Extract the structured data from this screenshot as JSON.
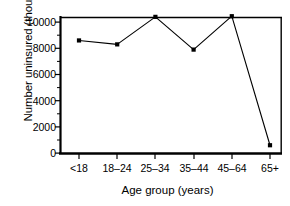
{
  "chart_data": {
    "type": "line",
    "title": "",
    "xlabel": "Age group (years)",
    "ylabel": "Number uninsured (thousands)",
    "categories": [
      "<18",
      "18–24",
      "25–34",
      "35–44",
      "45–64",
      "65+"
    ],
    "values": [
      8600,
      8300,
      10400,
      7900,
      10450,
      600
    ],
    "series": [
      {
        "name": "Number uninsured",
        "values": [
          8600,
          8300,
          10400,
          7900,
          10450,
          600
        ]
      }
    ],
    "ylim": [
      0,
      11200
    ],
    "yticks": [
      0,
      2000,
      4000,
      6000,
      8000,
      10000
    ],
    "ytick_labels": [
      "0",
      "2000",
      "4000",
      "6000",
      "8000",
      "10000"
    ],
    "xtick_labels": [
      "<18",
      "18–24",
      "25–34",
      "35–44",
      "45–64",
      "65+"
    ],
    "grid": false,
    "legend": "none",
    "marker": "filled-square",
    "line_color": "#000000",
    "marker_color": "#000000",
    "axis_color": "#000000",
    "background_color": "#ffffff"
  }
}
